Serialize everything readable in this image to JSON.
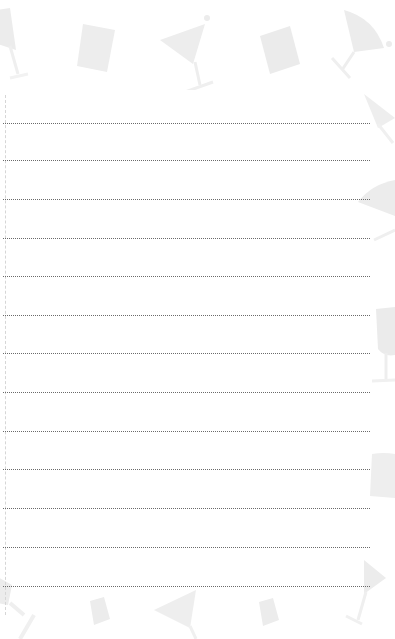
{
  "page": {
    "type": "lined notepad page",
    "background_color": "#ffffff",
    "decoration_color": "#eeeeee",
    "rule_color": "#6a6a6a",
    "rule_count": 13,
    "rules_y": [
      123,
      160,
      199,
      238,
      276,
      315,
      353,
      392,
      431,
      469,
      508,
      547,
      586
    ],
    "decorations": [
      "martini-glass-icon",
      "tumbler-glass-icon",
      "martini-glass-icon",
      "tumbler-glass-icon",
      "martini-glass-icon",
      "martini-glass-icon",
      "wine-glass-icon",
      "tumbler-glass-icon",
      "martini-glass-icon",
      "tumbler-glass-icon",
      "martini-glass-icon",
      "tumbler-glass-icon",
      "martini-glass-icon"
    ]
  }
}
